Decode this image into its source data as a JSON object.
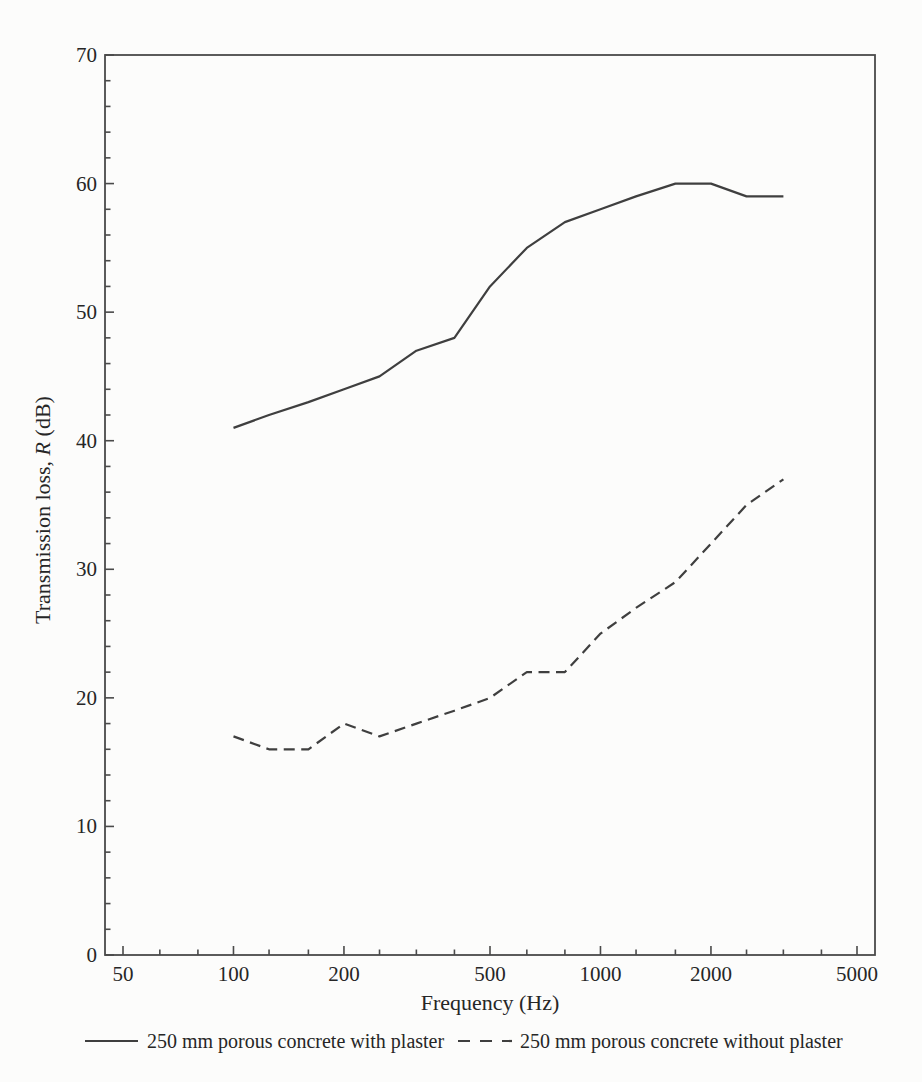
{
  "figure": {
    "background_color": "#fcfcfb",
    "kind": "scanned book figure"
  },
  "labels": {
    "ylabel_prefix": "Transmission loss, ",
    "ylabel_var": "R",
    "ylabel_suffix": " (dB)"
  },
  "chart_data": {
    "type": "line",
    "title": "",
    "xlabel": "Frequency (Hz)",
    "ylabel": "Transmission loss, R (dB)",
    "x_scale": "log",
    "x_range_hz": [
      45,
      5600
    ],
    "ylim": [
      0,
      70
    ],
    "y_major_tick_step": 10,
    "y_minor_tick_step": 2,
    "x_major_ticks": [
      50,
      100,
      200,
      500,
      1000,
      2000,
      5000
    ],
    "x_minor_ticks": [
      50,
      63,
      80,
      100,
      125,
      160,
      200,
      250,
      315,
      400,
      500,
      630,
      800,
      1000,
      1250,
      1600,
      2000,
      2500,
      3150,
      4000,
      5000
    ],
    "grid": false,
    "legend_position": "bottom",
    "colors": {
      "line": "#3f3f3f",
      "text": "#262626",
      "axis": "#4a4a4a"
    },
    "series": [
      {
        "name": "250 mm porous concrete with plaster",
        "style": "solid",
        "x": [
          100,
          125,
          160,
          200,
          250,
          315,
          400,
          500,
          630,
          800,
          1000,
          1250,
          1600,
          2000,
          2500,
          3150
        ],
        "y": [
          41,
          42,
          43,
          44,
          45,
          47,
          48,
          52,
          55,
          57,
          58,
          59,
          60,
          60,
          59,
          59
        ]
      },
      {
        "name": "250 mm porous concrete without plaster",
        "style": "dashed",
        "x": [
          100,
          125,
          160,
          200,
          250,
          315,
          400,
          500,
          630,
          800,
          1000,
          1250,
          1600,
          2000,
          2500,
          3150
        ],
        "y": [
          17,
          16,
          16,
          18,
          17,
          18,
          19,
          20,
          22,
          22,
          25,
          27,
          29,
          32,
          35,
          37
        ]
      }
    ]
  }
}
